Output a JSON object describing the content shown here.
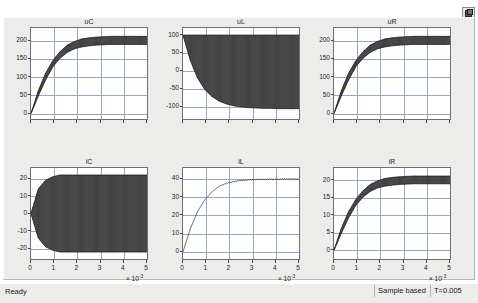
{
  "window": {
    "title": "Scope",
    "maximize_icon": "maximize-restore-icon"
  },
  "status_bar": {
    "ready_label": "Ready",
    "mode_label": "Sample based",
    "time_label": "T=0.005"
  },
  "axis_exponent": "× 10",
  "axis_exponent_sup": "-3",
  "chart_data": [
    {
      "type": "line",
      "title": "uC",
      "xlabel": "",
      "ylabel": "",
      "xlim": [
        0,
        0.005
      ],
      "ylim": [
        -15,
        235
      ],
      "xticks": [
        0,
        1,
        2,
        3,
        4,
        5
      ],
      "xticklabels": [
        "",
        "",
        "",
        "",
        "",
        ""
      ],
      "yticks": [
        0,
        50,
        100,
        150,
        200
      ],
      "yticklabels": [
        "0",
        "50",
        "100",
        "150",
        "200"
      ],
      "grid": true,
      "legend": "none",
      "description": "Capacitor voltage: exponential rise to about 200 V with switching ripple of roughly +/-12 V after settling",
      "envelope_upper": [
        0,
        62,
        110,
        145,
        170,
        188,
        198,
        205,
        208,
        210,
        211,
        212,
        212,
        212,
        212,
        212,
        212
      ],
      "envelope_lower": [
        0,
        48,
        92,
        128,
        152,
        168,
        178,
        183,
        186,
        188,
        189,
        190,
        190,
        190,
        190,
        190,
        190
      ],
      "final_value": 200
    },
    {
      "type": "line",
      "title": "uL",
      "xlabel": "",
      "ylabel": "",
      "xlim": [
        0,
        0.005
      ],
      "ylim": [
        -135,
        120
      ],
      "xticks": [
        0,
        1,
        2,
        3,
        4,
        5
      ],
      "xticklabels": [
        "",
        "",
        "",
        "",
        "",
        ""
      ],
      "yticks": [
        -100,
        -50,
        0,
        50,
        100
      ],
      "yticklabels": [
        "-100",
        "-50",
        "0",
        "50",
        "100"
      ],
      "grid": true,
      "legend": "none",
      "description": "Inductor voltage: chopped square wave, upper envelope held near +100 V, lower envelope decaying from +100 V down to about -100 V",
      "envelope_upper": [
        100,
        100,
        100,
        100,
        100,
        100,
        100,
        100,
        100,
        100,
        100,
        100,
        100,
        100,
        100,
        100,
        100
      ],
      "envelope_lower": [
        100,
        30,
        -20,
        -52,
        -72,
        -85,
        -93,
        -98,
        -101,
        -103,
        -104,
        -105,
        -105,
        -106,
        -106,
        -106,
        -106
      ],
      "final_value": -100
    },
    {
      "type": "line",
      "title": "uR",
      "xlabel": "",
      "ylabel": "",
      "xlim": [
        0,
        0.005
      ],
      "ylim": [
        -15,
        235
      ],
      "xticks": [
        0,
        1,
        2,
        3,
        4,
        5
      ],
      "xticklabels": [
        "",
        "",
        "",
        "",
        "",
        ""
      ],
      "yticks": [
        0,
        50,
        100,
        150,
        200
      ],
      "yticklabels": [
        "0",
        "50",
        "100",
        "150",
        "200"
      ],
      "grid": true,
      "legend": "none",
      "description": "Resistor voltage: exponential rise to about 200 V with switching ripple of roughly +/-12 V after settling",
      "envelope_upper": [
        0,
        62,
        110,
        145,
        170,
        188,
        198,
        205,
        208,
        210,
        211,
        212,
        212,
        212,
        212,
        212,
        212
      ],
      "envelope_lower": [
        0,
        48,
        92,
        128,
        152,
        168,
        178,
        183,
        186,
        188,
        189,
        190,
        190,
        190,
        190,
        190,
        190
      ],
      "final_value": 200
    },
    {
      "type": "line",
      "title": "iC",
      "xlabel": "",
      "ylabel": "",
      "xlim": [
        0,
        0.005
      ],
      "ylim": [
        -26,
        26
      ],
      "xticks": [
        0,
        1,
        2,
        3,
        4,
        5
      ],
      "xticklabels": [
        "0",
        "1",
        "2",
        "3",
        "4",
        "5"
      ],
      "yticks": [
        -20,
        -10,
        0,
        10,
        20
      ],
      "yticklabels": [
        "-20",
        "-10",
        "0",
        "10",
        "20"
      ],
      "grid": true,
      "legend": "none",
      "description": "Capacitor current: symmetric chopped waveform about zero, envelope growing from 0 to about +/-22 A",
      "envelope_upper": [
        0,
        14,
        19,
        21,
        22,
        22,
        22,
        22,
        22,
        22,
        22,
        22,
        22,
        22,
        22,
        22,
        22
      ],
      "envelope_lower": [
        0,
        -14,
        -19,
        -21,
        -22,
        -22,
        -22,
        -22,
        -22,
        -22,
        -22,
        -22,
        -22,
        -22,
        -22,
        -22,
        -22
      ],
      "final_value": 0
    },
    {
      "type": "line",
      "title": "iL",
      "xlabel": "",
      "ylabel": "",
      "xlim": [
        0,
        0.005
      ],
      "ylim": [
        -4,
        46
      ],
      "xticks": [
        0,
        1,
        2,
        3,
        4,
        5
      ],
      "xticklabels": [
        "0",
        "1",
        "2",
        "3",
        "4",
        "5"
      ],
      "yticks": [
        0,
        10,
        20,
        30,
        40
      ],
      "yticklabels": [
        "0",
        "10",
        "20",
        "30",
        "40"
      ],
      "grid": true,
      "legend": "none",
      "description": "Inductor current: smooth exponential rise to about 40 A with very small ripple after 2 ms",
      "envelope_upper": [
        0,
        12.5,
        22,
        28.5,
        33,
        36,
        37.8,
        38.8,
        39.4,
        39.7,
        39.9,
        40,
        40.1,
        40.1,
        40.2,
        40.2,
        40.2
      ],
      "envelope_lower": [
        0,
        12.5,
        22,
        28.5,
        33,
        36,
        37.4,
        38.3,
        38.9,
        39.2,
        39.4,
        39.5,
        39.6,
        39.6,
        39.7,
        39.7,
        39.7
      ],
      "final_value": 40
    },
    {
      "type": "line",
      "title": "iR",
      "xlabel": "",
      "ylabel": "",
      "xlim": [
        0,
        0.005
      ],
      "ylim": [
        -2.5,
        23.5
      ],
      "xticks": [
        0,
        1,
        2,
        3,
        4,
        5
      ],
      "xticklabels": [
        "0",
        "1",
        "2",
        "3",
        "4",
        "5"
      ],
      "yticks": [
        0,
        5,
        10,
        15,
        20
      ],
      "yticklabels": [
        "0",
        "5",
        "10",
        "15",
        "20"
      ],
      "grid": true,
      "legend": "none",
      "description": "Resistor current: exponential rise to about 20 A with switching ripple of roughly +/-1.2 A after settling",
      "envelope_upper": [
        0,
        6.2,
        11,
        14.5,
        17,
        18.8,
        19.8,
        20.5,
        20.8,
        21,
        21.1,
        21.2,
        21.2,
        21.2,
        21.2,
        21.2,
        21.2
      ],
      "envelope_lower": [
        0,
        4.8,
        9.2,
        12.8,
        15.2,
        16.8,
        17.8,
        18.3,
        18.6,
        18.8,
        18.9,
        19,
        19,
        19,
        19,
        19,
        19
      ],
      "final_value": 20
    }
  ]
}
